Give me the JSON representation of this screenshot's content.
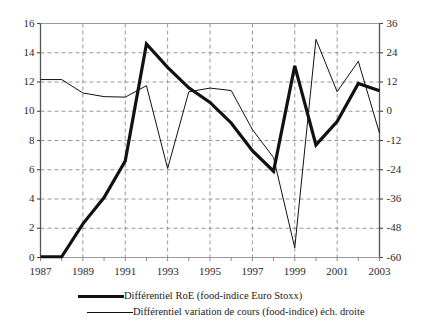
{
  "chart_data": {
    "type": "line",
    "title": "",
    "subtitle": "",
    "xlabel": "",
    "ylabel": "",
    "grid": true,
    "legend_position": "bottom",
    "x": [
      1987,
      1988,
      1989,
      1990,
      1991,
      1992,
      1993,
      1994,
      1995,
      1996,
      1997,
      1998,
      1999,
      2000,
      2001,
      2002,
      2003
    ],
    "xlim": [
      1987,
      2003
    ],
    "x_tick_labels": [
      "1987",
      "1989",
      "1991",
      "1993",
      "1995",
      "1997",
      "1999",
      "2001",
      "2003"
    ],
    "x_tick_values": [
      1987,
      1989,
      1991,
      1993,
      1995,
      1997,
      1999,
      2001,
      2003
    ],
    "axes": [
      {
        "id": "left",
        "side": "left",
        "ylim": [
          0,
          16
        ],
        "ticks": [
          0,
          2,
          4,
          6,
          8,
          10,
          12,
          14,
          16
        ],
        "tick_labels": [
          "0",
          "2",
          "4",
          "6",
          "8",
          "10",
          "12",
          "14",
          "16"
        ]
      },
      {
        "id": "right",
        "side": "right",
        "ylim": [
          -60,
          36
        ],
        "ticks": [
          -60,
          -48,
          -36,
          -24,
          -12,
          0,
          12,
          24,
          36
        ],
        "tick_labels": [
          "-60",
          "-48",
          "-36",
          "-24",
          "-12",
          "0",
          "12",
          "24",
          "36"
        ]
      }
    ],
    "series": [
      {
        "name": "Différentiel RoE (food-indice Euro Stoxx)",
        "axis": "left",
        "style": "thick",
        "color": "#111111",
        "width": 3.2,
        "values": [
          0.05,
          0.05,
          2.3,
          4.1,
          6.6,
          14.6,
          13.0,
          11.6,
          10.6,
          9.2,
          7.3,
          5.9,
          13.1,
          7.7,
          9.3,
          11.9,
          11.4
        ]
      },
      {
        "name": "Différentiel variation de cours (food-indice) éch. droite",
        "axis": "right",
        "style": "thin",
        "color": "#111111",
        "width": 1,
        "values": [
          13.0,
          13.0,
          7.5,
          6.0,
          5.8,
          10.5,
          -23.5,
          8.0,
          9.5,
          8.5,
          -7.5,
          -19.0,
          -56.0,
          29.5,
          8.0,
          20.5,
          -9.0
        ]
      }
    ]
  },
  "legend": {
    "items": [
      {
        "label": "Différentiel RoE (food-indice Euro Stoxx)",
        "style": "thick"
      },
      {
        "label": "Différentiel variation de cours (food-indice) éch. droite",
        "style": "thin"
      }
    ]
  }
}
